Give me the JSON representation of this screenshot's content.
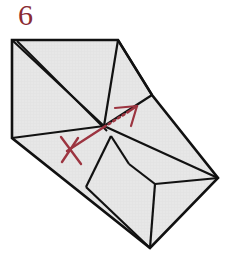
{
  "figure": {
    "step_label": "6",
    "step_label_color": "#8a2b33",
    "type": "origami-instruction-diagram",
    "background_color": "#ffffff",
    "paper_fill_color": "#e6e6e6",
    "paper_line_color": "#111111",
    "arrow_color": "#9c3440",
    "canvas": {
      "width": 235,
      "height": 269
    }
  },
  "paper": {
    "name": "folded-paper-shape",
    "outline_points": "12,40 118,40 152,95 218,178 150,248 12,138",
    "fold_lines": [
      {
        "name": "fold-top-left-to-center",
        "d": "M 12,40 L 104,126"
      },
      {
        "name": "fold-open-edge-inner",
        "d": "M 17,41 L 107,131"
      },
      {
        "name": "fold-top-right-to-center",
        "d": "M 118,40 L 104,126"
      },
      {
        "name": "fold-top-right-to-right-vertex",
        "d": "M 118,40 L 152,95"
      },
      {
        "name": "fold-right-junction-to-center",
        "d": "M 152,95 L 104,126"
      },
      {
        "name": "fold-center-to-right-point",
        "d": "M 104,126 L 218,178"
      },
      {
        "name": "fold-center-to-left-vertex",
        "d": "M 104,126 L 12,138"
      },
      {
        "name": "fold-center-to-bottom-notch",
        "d": "M 111,136 L 86,187"
      },
      {
        "name": "fold-notch-left-to-bottom-vertex",
        "d": "M 86,187 L 150,248"
      },
      {
        "name": "fold-center-spur-down",
        "d": "M 111,136 L 129,164"
      },
      {
        "name": "fold-notch-inner-horizontal",
        "d": "M 129,164 L 155,184"
      },
      {
        "name": "fold-notch-step-right",
        "d": "M 155,184 L 218,178"
      },
      {
        "name": "fold-notch-vertical",
        "d": "M 155,184 L 150,248"
      }
    ],
    "vertices": [
      {
        "name": "vertex-top-left",
        "x": 12,
        "y": 40
      },
      {
        "name": "vertex-top-right",
        "x": 118,
        "y": 40
      },
      {
        "name": "vertex-right-junction",
        "x": 152,
        "y": 95
      },
      {
        "name": "vertex-right-point",
        "x": 218,
        "y": 178
      },
      {
        "name": "vertex-bottom",
        "x": 150,
        "y": 248
      },
      {
        "name": "vertex-left",
        "x": 12,
        "y": 138
      },
      {
        "name": "vertex-center",
        "x": 104,
        "y": 126
      }
    ]
  },
  "annotations": {
    "arrow": {
      "name": "fold-direction-arrow",
      "color": "#9c3440",
      "solid_tail_d": "M 67,151 L 104,127",
      "dotted_mid_d": "M 104,127 L 128,112",
      "solid_head_d": "M 128,112 L 137,106",
      "head_left_d": "M 137,106 L 115,108",
      "head_right_d": "M 137,106 L 131,126",
      "dash_pattern": "2,3"
    },
    "cross_mark": {
      "name": "x-cross-mark",
      "color": "#9c3440",
      "stroke_a_d": "M 61,137 L 81,164",
      "stroke_b_d": "M 78,138 L 62,162"
    }
  }
}
